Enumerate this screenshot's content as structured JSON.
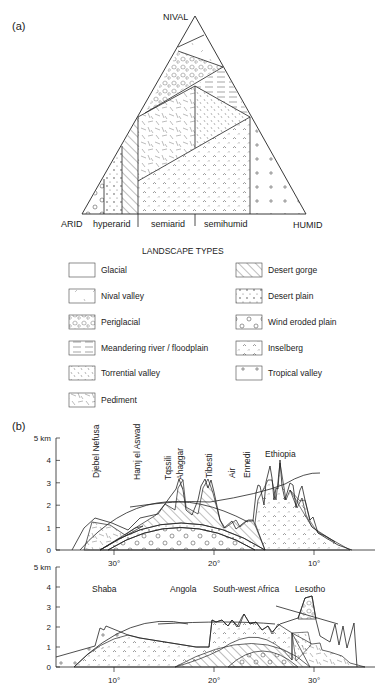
{
  "panel_a": {
    "label": "(a)",
    "vertices": {
      "top": "NIVAL",
      "left": "ARID",
      "right": "HUMID"
    },
    "base_labels": [
      "hyperarid",
      "semiarid",
      "semihumid"
    ],
    "legend_title": "LANDSCAPE TYPES",
    "legend": [
      {
        "label": "Glacial",
        "pattern": "blank"
      },
      {
        "label": "Nival valley",
        "pattern": "sparse-dash"
      },
      {
        "label": "Periglacial",
        "pattern": "blobs"
      },
      {
        "label": "Meandering river / floodplain",
        "pattern": "horizontal-lines"
      },
      {
        "label": "Torrential valley",
        "pattern": "short-dashes"
      },
      {
        "label": "Pediment",
        "pattern": "random-dashes"
      },
      {
        "label": "Desert gorge",
        "pattern": "diagonal-hatch"
      },
      {
        "label": "Desert plain",
        "pattern": "dots"
      },
      {
        "label": "Wind eroded plain",
        "pattern": "circles"
      },
      {
        "label": "Inselberg",
        "pattern": "carets"
      },
      {
        "label": "Tropical valley",
        "pattern": "crosses"
      }
    ]
  },
  "panel_b": {
    "label": "(b)",
    "top_profile": {
      "y_ticks": [
        "0",
        "1",
        "2",
        "3",
        "4",
        "5 km"
      ],
      "x_ticks": [
        "30°",
        "20°",
        "10°"
      ],
      "place_labels_vertical": [
        "Djebel Nefusa",
        "Hamj el Aswad",
        "Tqssili",
        "Ahaggar",
        "Tibesti",
        "Air",
        "Ennedi"
      ],
      "place_label_horizontal": "Ethiopia"
    },
    "bottom_profile": {
      "y_ticks": [
        "0",
        "1",
        "2",
        "3",
        "4",
        "5 km"
      ],
      "x_ticks": [
        "10°",
        "20°",
        "30°"
      ],
      "place_labels": [
        "Shaba",
        "Angola",
        "South-west Africa",
        "Lesotho"
      ]
    }
  },
  "chart_data": [
    {
      "type": "ternary",
      "title": "(a)",
      "vertices": [
        "NIVAL",
        "ARID",
        "HUMID"
      ],
      "base_zones": [
        "hyperarid",
        "semiarid",
        "semihumid"
      ],
      "regions": [
        "Glacial",
        "Nival valley",
        "Periglacial",
        "Meandering river / floodplain",
        "Torrential valley",
        "Pediment",
        "Desert gorge",
        "Desert plain",
        "Wind eroded plain",
        "Inselberg",
        "Tropical valley"
      ]
    },
    {
      "type": "line",
      "title": "(b) northern profile",
      "ylabel": "km",
      "ylim": [
        0,
        5
      ],
      "xlim_deg": [
        36,
        0
      ],
      "x_ticks": [
        30,
        20,
        10
      ],
      "y_ticks": [
        0,
        1,
        2,
        3,
        4,
        5
      ],
      "peaks": [
        {
          "name": "Djebel Nefusa",
          "lon": 30.5,
          "km": 1.0
        },
        {
          "name": "Ahaggar",
          "lon": 22.3,
          "km": 3.0
        },
        {
          "name": "Tibesti",
          "lon": 18.6,
          "km": 3.3
        },
        {
          "name": "Ethiopia",
          "lon": 11.2,
          "km": 4.5
        }
      ]
    },
    {
      "type": "line",
      "title": "(b) southern profile",
      "ylabel": "km",
      "ylim": [
        0,
        5
      ],
      "xlim_deg": [
        4,
        36
      ],
      "x_ticks": [
        10,
        20,
        30
      ],
      "y_ticks": [
        0,
        1,
        2,
        3,
        4,
        5
      ],
      "peaks": [
        {
          "name": "Shaba",
          "lon": 9.0,
          "km": 1.85
        },
        {
          "name": "South-west Africa",
          "lon": 23.0,
          "km": 2.4
        },
        {
          "name": "Lesotho",
          "lon": 29.5,
          "km": 3.5
        }
      ]
    }
  ]
}
